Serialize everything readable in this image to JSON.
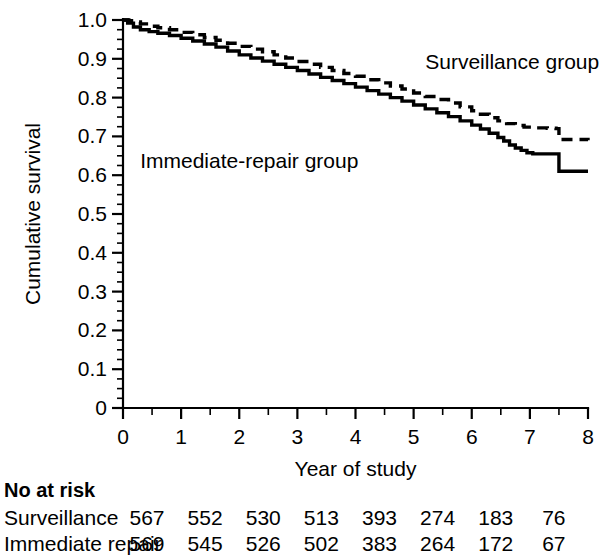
{
  "chart_data": {
    "type": "line",
    "title": "",
    "xlabel": "Year of study",
    "ylabel": "Cumulative survival",
    "xlim": [
      0,
      8
    ],
    "ylim": [
      0,
      1.0
    ],
    "grid": false,
    "legend_position": "inline-annotation",
    "x_ticks": [
      "0",
      "1",
      "2",
      "3",
      "4",
      "5",
      "6",
      "7",
      "8"
    ],
    "x_tick_values": [
      0,
      1,
      2,
      3,
      4,
      5,
      6,
      7,
      8
    ],
    "x_minor_interval": 0.25,
    "y_ticks": [
      "0",
      "0.1",
      "0.2",
      "0.3",
      "0.4",
      "0.5",
      "0.6",
      "0.7",
      "0.8",
      "0.9",
      "1.0"
    ],
    "y_tick_values": [
      0,
      0.1,
      0.2,
      0.3,
      0.4,
      0.5,
      0.6,
      0.7,
      0.8,
      0.9,
      1.0
    ],
    "y_minor_interval": 0.025,
    "series": [
      {
        "name": "Surveillance group",
        "style": "dashed",
        "label": "Surveillance group",
        "label_x": 5.2,
        "label_y": 0.875,
        "points": [
          [
            0.0,
            1.0
          ],
          [
            0.1,
            0.998
          ],
          [
            0.2,
            0.995
          ],
          [
            0.3,
            0.99
          ],
          [
            0.45,
            0.984
          ],
          [
            0.6,
            0.98
          ],
          [
            0.8,
            0.975
          ],
          [
            1.0,
            0.968
          ],
          [
            1.2,
            0.962
          ],
          [
            1.4,
            0.955
          ],
          [
            1.6,
            0.948
          ],
          [
            1.8,
            0.94
          ],
          [
            2.0,
            0.932
          ],
          [
            2.2,
            0.925
          ],
          [
            2.4,
            0.918
          ],
          [
            2.6,
            0.91
          ],
          [
            2.8,
            0.902
          ],
          [
            3.0,
            0.893
          ],
          [
            3.2,
            0.886
          ],
          [
            3.4,
            0.878
          ],
          [
            3.6,
            0.87
          ],
          [
            3.8,
            0.862
          ],
          [
            4.0,
            0.855
          ],
          [
            4.2,
            0.846
          ],
          [
            4.4,
            0.838
          ],
          [
            4.6,
            0.83
          ],
          [
            4.8,
            0.822
          ],
          [
            5.0,
            0.812
          ],
          [
            5.2,
            0.803
          ],
          [
            5.4,
            0.795
          ],
          [
            5.6,
            0.786
          ],
          [
            5.8,
            0.776
          ],
          [
            6.0,
            0.766
          ],
          [
            6.15,
            0.757
          ],
          [
            6.3,
            0.748
          ],
          [
            6.45,
            0.74
          ],
          [
            6.6,
            0.733
          ],
          [
            6.75,
            0.728
          ],
          [
            6.9,
            0.724
          ],
          [
            7.05,
            0.722
          ],
          [
            7.3,
            0.721
          ],
          [
            7.45,
            0.72
          ],
          [
            7.5,
            0.692
          ],
          [
            8.0,
            0.69
          ]
        ]
      },
      {
        "name": "Immediate-repair group",
        "style": "solid",
        "label": "Immediate-repair group",
        "label_x": 4.05,
        "label_y": 0.618,
        "points": [
          [
            0.0,
            1.0
          ],
          [
            0.08,
            0.992
          ],
          [
            0.18,
            0.982
          ],
          [
            0.3,
            0.975
          ],
          [
            0.45,
            0.97
          ],
          [
            0.6,
            0.966
          ],
          [
            0.8,
            0.96
          ],
          [
            1.0,
            0.953
          ],
          [
            1.2,
            0.946
          ],
          [
            1.4,
            0.938
          ],
          [
            1.6,
            0.93
          ],
          [
            1.8,
            0.92
          ],
          [
            2.0,
            0.91
          ],
          [
            2.2,
            0.902
          ],
          [
            2.4,
            0.894
          ],
          [
            2.6,
            0.886
          ],
          [
            2.8,
            0.878
          ],
          [
            3.0,
            0.87
          ],
          [
            3.2,
            0.861
          ],
          [
            3.4,
            0.852
          ],
          [
            3.6,
            0.844
          ],
          [
            3.8,
            0.836
          ],
          [
            4.0,
            0.827
          ],
          [
            4.2,
            0.818
          ],
          [
            4.4,
            0.809
          ],
          [
            4.6,
            0.8
          ],
          [
            4.8,
            0.791
          ],
          [
            5.0,
            0.781
          ],
          [
            5.2,
            0.771
          ],
          [
            5.4,
            0.761
          ],
          [
            5.6,
            0.751
          ],
          [
            5.8,
            0.74
          ],
          [
            6.0,
            0.729
          ],
          [
            6.15,
            0.719
          ],
          [
            6.3,
            0.708
          ],
          [
            6.45,
            0.697
          ],
          [
            6.55,
            0.688
          ],
          [
            6.65,
            0.678
          ],
          [
            6.75,
            0.67
          ],
          [
            6.85,
            0.664
          ],
          [
            6.95,
            0.658
          ],
          [
            7.05,
            0.655
          ],
          [
            7.45,
            0.655
          ],
          [
            7.5,
            0.61
          ],
          [
            8.0,
            0.61
          ]
        ]
      }
    ]
  },
  "risk_table": {
    "heading": "No at risk",
    "columns": [
      0,
      1,
      2,
      3,
      4,
      5,
      6,
      7,
      8
    ],
    "rows": [
      {
        "label": "Surveillance",
        "values": [
          "567",
          "552",
          "530",
          "513",
          "393",
          "274",
          "183",
          "76"
        ]
      },
      {
        "label": "Immediate repair",
        "values": [
          "569",
          "545",
          "526",
          "502",
          "383",
          "264",
          "172",
          "67"
        ]
      }
    ]
  }
}
